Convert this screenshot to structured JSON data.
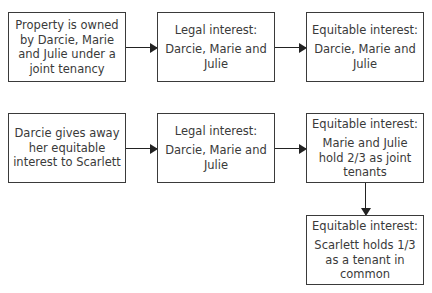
{
  "row1": {
    "start": {
      "text": "Property is owned by Darcie, Marie and Julie under a joint tenancy"
    },
    "legal": {
      "title": "Legal interest:",
      "body": "Darcie, Marie and Julie"
    },
    "equitable": {
      "title": "Equitable interest:",
      "body": "Darcie, Marie and Julie"
    }
  },
  "row2": {
    "start": {
      "text": "Darcie gives away her equitable interest to Scarlett"
    },
    "legal": {
      "title": "Legal interest:",
      "body": "Darcie, Marie and Julie"
    },
    "equitable": {
      "title": "Equitable interest:",
      "body": "Marie and Julie hold 2/3 as joint tenants"
    },
    "equitable_split": {
      "title": "Equitable interest:",
      "body": "Scarlett holds 1/3 as a tenant in common"
    }
  }
}
